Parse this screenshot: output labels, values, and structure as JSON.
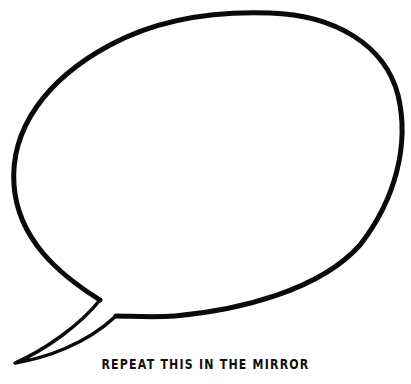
{
  "illustration": {
    "type": "speech-bubble",
    "stroke_color": "#0a0a0a",
    "background": "#ffffff"
  },
  "caption": {
    "text": "REPEAT THIS IN THE MIRROR"
  }
}
